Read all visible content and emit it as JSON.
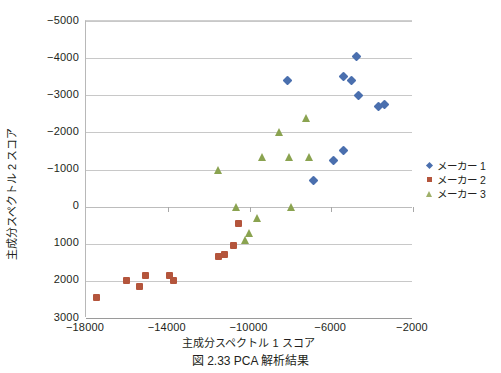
{
  "caption": "図 2.33   PCA 解析結果",
  "legend": {
    "position": "right",
    "entries": [
      {
        "label": "メーカー 1",
        "marker": "diamond",
        "color": "#4a6fae"
      },
      {
        "label": "メーカー 2",
        "marker": "square",
        "color": "#b4553c"
      },
      {
        "label": "メーカー 3",
        "marker": "triangle",
        "color": "#8aa350"
      }
    ]
  },
  "chart_data": {
    "type": "scatter",
    "title": "",
    "xlabel": "主成分スペクトル 1 スコア",
    "ylabel": "主成分スペクトル 2 スコア",
    "xlim": [
      -18000,
      -2000
    ],
    "ylim": [
      -5000,
      3000
    ],
    "y_axis_inverted": true,
    "xticks": [
      -18000,
      -14000,
      -10000,
      -6000,
      -2000
    ],
    "xtick_labels": [
      "−18000",
      "−14000",
      "−10000",
      "−6000",
      "−2000"
    ],
    "yticks": [
      -5000,
      -4000,
      -3000,
      -2000,
      -1000,
      0,
      1000,
      2000,
      3000
    ],
    "ytick_labels": [
      "−5000",
      "−4000",
      "−3000",
      "−2000",
      "−1000",
      "0",
      "1000",
      "2000",
      "3000"
    ],
    "grid": true,
    "grid_axis": "y",
    "series": [
      {
        "name": "メーカー 1",
        "marker": "diamond",
        "color": "#4a6fae",
        "points": [
          [
            -8150,
            -3400
          ],
          [
            -5400,
            -3500
          ],
          [
            -5000,
            -3400
          ],
          [
            -4750,
            -4050
          ],
          [
            -4650,
            -3000
          ],
          [
            -3700,
            -2700
          ],
          [
            -3400,
            -2750
          ],
          [
            -5400,
            -1500
          ],
          [
            -5900,
            -1250
          ],
          [
            -6850,
            -700
          ]
        ]
      },
      {
        "name": "メーカー 2",
        "marker": "square",
        "color": "#b4553c",
        "points": [
          [
            -17500,
            2450
          ],
          [
            -16000,
            2000
          ],
          [
            -15400,
            2150
          ],
          [
            -15100,
            1850
          ],
          [
            -13900,
            1850
          ],
          [
            -13700,
            2000
          ],
          [
            -11500,
            1350
          ],
          [
            -11200,
            1300
          ],
          [
            -10800,
            1050
          ],
          [
            -10550,
            450
          ]
        ]
      },
      {
        "name": "メーカー 3",
        "marker": "triangle",
        "color": "#8aa350",
        "points": [
          [
            -11500,
            -1000
          ],
          [
            -10650,
            0
          ],
          [
            -10200,
            900
          ],
          [
            -10000,
            700
          ],
          [
            -9600,
            300
          ],
          [
            -9350,
            -1350
          ],
          [
            -8550,
            -2000
          ],
          [
            -8050,
            -1350
          ],
          [
            -7950,
            0
          ],
          [
            -7200,
            -2400
          ],
          [
            -7050,
            -1350
          ]
        ]
      }
    ]
  }
}
